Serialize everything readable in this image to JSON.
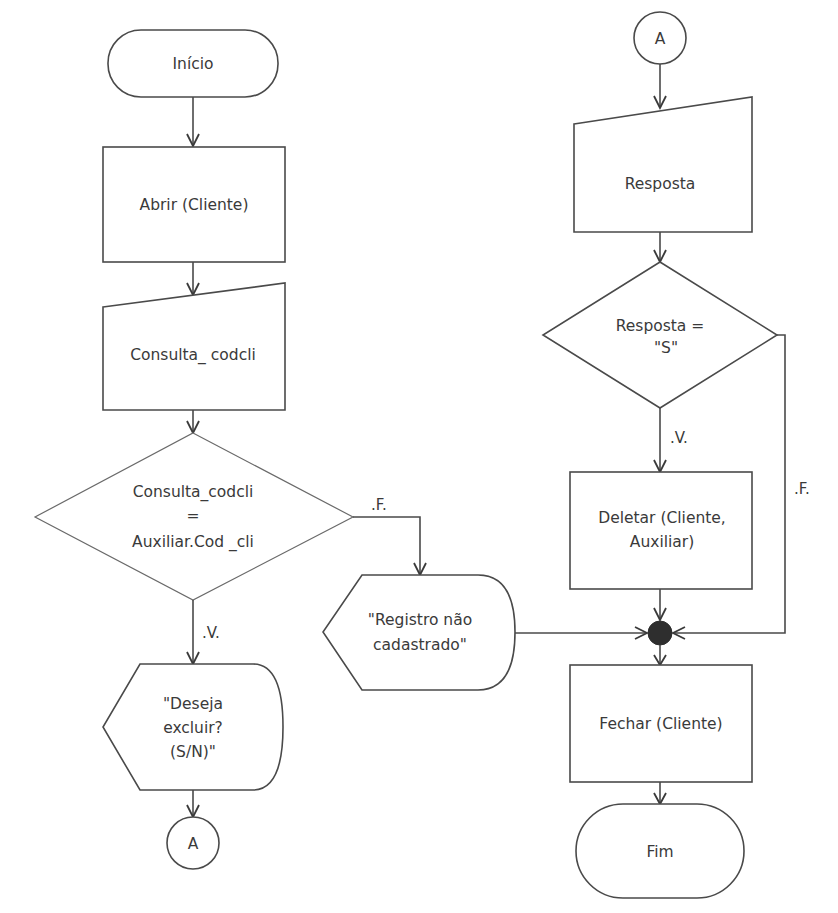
{
  "diagram": {
    "type": "flowchart",
    "left_column": {
      "start": {
        "label": "Início",
        "shape": "terminal"
      },
      "open": {
        "label": "Abrir (Cliente)",
        "shape": "process"
      },
      "input": {
        "label": "Consulta_ codcli",
        "shape": "manual-input"
      },
      "decision": {
        "line1": "Consulta_codcli",
        "line2": "=",
        "line3": "Auxiliar.Cod _cli",
        "shape": "decision"
      },
      "true_label": ".V.",
      "false_label": ".F.",
      "confirm_display": {
        "line1": "\"Deseja",
        "line2": "excluir?",
        "line3": "(S/N)\"",
        "shape": "display"
      },
      "connector_out": {
        "label": "A",
        "shape": "connector"
      }
    },
    "middle": {
      "not_found_display": {
        "line1": "\"Registro não",
        "line2": "cadastrado\"",
        "shape": "display"
      }
    },
    "right_column": {
      "connector_in": {
        "label": "A",
        "shape": "connector"
      },
      "input": {
        "label": "Resposta",
        "shape": "manual-input"
      },
      "decision": {
        "line1": "Resposta =",
        "line2": "\"S\"",
        "shape": "decision"
      },
      "true_label": ".V.",
      "false_label": ".F.",
      "delete": {
        "line1": "Deletar (Cliente,",
        "line2": "Auxiliar)",
        "shape": "process"
      },
      "merge": {
        "shape": "merge-point"
      },
      "close": {
        "label": "Fechar (Cliente)",
        "shape": "process"
      },
      "end": {
        "label": "Fim",
        "shape": "terminal"
      }
    },
    "colors": {
      "stroke": "#4a4a4a",
      "text": "#3a3a3a",
      "merge_fill": "#2e2e2e",
      "background": "#ffffff"
    }
  }
}
